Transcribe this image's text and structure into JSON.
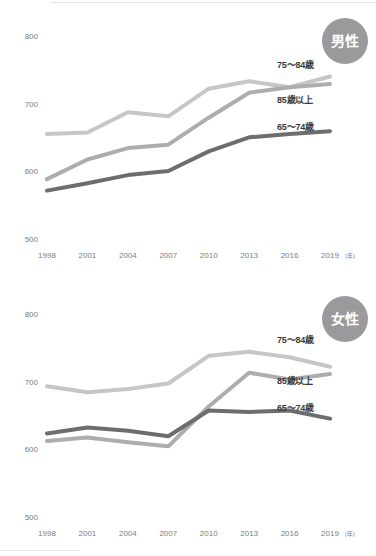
{
  "figure": {
    "unit_note": "(年)"
  },
  "charts": [
    {
      "id": "male",
      "badge": "男性",
      "badge_color": "#9a9a9c",
      "chart_data": {
        "type": "line",
        "title": "男性",
        "xlabel": "(年)",
        "ylabel": "",
        "x": [
          1998,
          2001,
          2004,
          2007,
          2010,
          2013,
          2016,
          2019
        ],
        "categories": [
          "1998",
          "2001",
          "2004",
          "2007",
          "2010",
          "2013",
          "2016",
          "2019"
        ],
        "yticks": [
          500,
          600,
          700,
          800
        ],
        "ylim": [
          480,
          810
        ],
        "grid": false,
        "legend": "inline-right",
        "series": [
          {
            "name": "75～84歳",
            "color": "#c6c6c8",
            "values": [
              655,
              657,
              687,
              681,
              722,
              733,
              724,
              740
            ]
          },
          {
            "name": "85歳以上",
            "color": "#adadaf",
            "values": [
              588,
              617,
              634,
              639,
              679,
              716,
              724,
              729
            ]
          },
          {
            "name": "65～74歳",
            "color": "#6d6d6f",
            "values": [
              571,
              582,
              594,
              600,
              629,
              650,
              655,
              659
            ]
          }
        ]
      }
    },
    {
      "id": "female",
      "badge": "女性",
      "badge_color": "#9a9a9c",
      "chart_data": {
        "type": "line",
        "title": "女性",
        "xlabel": "(年)",
        "ylabel": "",
        "x": [
          1998,
          2001,
          2004,
          2007,
          2010,
          2013,
          2016,
          2019
        ],
        "categories": [
          "1998",
          "2001",
          "2004",
          "2007",
          "2010",
          "2013",
          "2016",
          "2019"
        ],
        "yticks": [
          500,
          600,
          700,
          800
        ],
        "ylim": [
          480,
          810
        ],
        "grid": false,
        "legend": "inline-right",
        "series": [
          {
            "name": "75～84歳",
            "color": "#c6c6c8",
            "values": [
              693,
              684,
              689,
              697,
              738,
              744,
              736,
              722
            ]
          },
          {
            "name": "85歳以上",
            "color": "#adadaf",
            "values": [
              612,
              617,
              610,
              604,
              663,
              713,
              703,
              711
            ]
          },
          {
            "name": "65～74歳",
            "color": "#6d6d6f",
            "values": [
              623,
              632,
              627,
              619,
              657,
              655,
              657,
              645
            ]
          }
        ]
      }
    }
  ],
  "axis": {
    "y_tick_labels": [
      "800",
      "700",
      "600",
      "500"
    ],
    "x_tick_labels": [
      "1998",
      "2001",
      "2004",
      "2007",
      "2010",
      "2013",
      "2016",
      "2019"
    ],
    "x_unit": "(年)"
  }
}
